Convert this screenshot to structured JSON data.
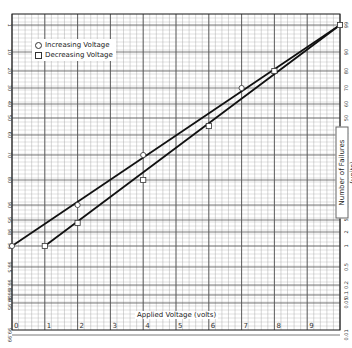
{
  "chart_data": {
    "type": "scatter",
    "title": "",
    "xlabel": "Applied Voltage (volts)",
    "ylabel": "Number of Failures (units)",
    "x_ticks": [
      0,
      1,
      2,
      3,
      4,
      5,
      6,
      7,
      8,
      9
    ],
    "xlim": [
      0,
      10
    ],
    "y_scale": "normal-probability",
    "y_ticks": [
      0.01,
      0.05,
      0.1,
      0.2,
      0.5,
      1,
      2,
      5,
      10,
      20,
      30,
      40,
      50,
      60,
      70,
      80,
      90,
      99
    ],
    "grid": true,
    "legend_position": "upper-left",
    "series": [
      {
        "name": "Increasing Voltage",
        "marker": "circle",
        "points": [
          [
            0,
            1
          ],
          [
            2,
            10
          ],
          [
            4,
            30
          ],
          [
            7,
            70
          ],
          [
            10,
            99
          ]
        ],
        "fit_line": [
          [
            0,
            1
          ],
          [
            10,
            99
          ]
        ]
      },
      {
        "name": "Decreasing Voltage",
        "marker": "square",
        "points": [
          [
            1,
            1
          ],
          [
            2,
            4
          ],
          [
            4,
            20
          ],
          [
            6,
            45
          ],
          [
            8,
            80
          ],
          [
            10,
            99
          ]
        ],
        "fit_line": [
          [
            1,
            1
          ],
          [
            10,
            99
          ]
        ]
      }
    ]
  },
  "legend": {
    "increasing": "Increasing Voltage",
    "decreasing": "Decreasing Voltage"
  },
  "axes": {
    "x_title": "Applied Voltage (volts)",
    "y_title": "Number of Failures (units)"
  }
}
